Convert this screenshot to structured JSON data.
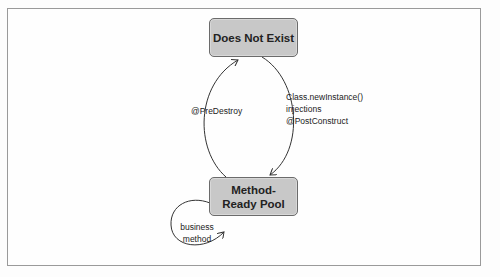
{
  "diagram": {
    "states": [
      {
        "id": "does-not-exist",
        "label": "Does Not Exist"
      },
      {
        "id": "method-ready-pool",
        "label": "Method-Ready Pool"
      }
    ],
    "transitions": [
      {
        "from": "does-not-exist",
        "to": "method-ready-pool",
        "label_lines": [
          "Class.newInstance()",
          "injections",
          "@PostConstruct"
        ]
      },
      {
        "from": "method-ready-pool",
        "to": "does-not-exist",
        "label_lines": [
          "@PreDestroy"
        ]
      },
      {
        "from": "method-ready-pool",
        "to": "method-ready-pool",
        "label_lines": [
          "business",
          "method"
        ]
      }
    ],
    "colors": {
      "state_fill": "#c8c8c8",
      "state_border": "#6b6b6b",
      "line": "#333333",
      "frame": "#9a9a9a"
    }
  }
}
